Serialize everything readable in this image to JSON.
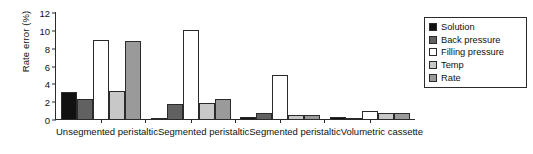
{
  "chart_data": {
    "type": "bar",
    "title": "",
    "subtitle": "",
    "xlabel": "",
    "ylabel": "Rate error (%)",
    "ylim": [
      0,
      12
    ],
    "yticks": [
      0,
      2,
      4,
      6,
      8,
      10,
      12
    ],
    "grid": false,
    "legend_position": "top-right",
    "categories": [
      "Unsegmented peristaltic",
      "Segmented peristaltic",
      "Segmented peristaltic",
      "Volumetric cassette"
    ],
    "series": [
      {
        "name": "Solution",
        "color": "#111111",
        "values": [
          3.0,
          0.15,
          0.2,
          0.25
        ]
      },
      {
        "name": "Back pressure",
        "color": "#616161",
        "values": [
          2.3,
          1.7,
          0.7,
          0.1
        ]
      },
      {
        "name": "Filling pressure",
        "color": "#ffffff",
        "values": [
          8.9,
          10.0,
          4.9,
          0.9
        ]
      },
      {
        "name": "Temp",
        "color": "#c8c8c8",
        "values": [
          3.1,
          1.8,
          0.4,
          0.7
        ]
      },
      {
        "name": "Rate",
        "color": "#9a9a9a",
        "values": [
          8.8,
          2.3,
          0.5,
          0.7
        ]
      }
    ]
  },
  "axis": {
    "y_title": "Rate error (%)",
    "y_tick_labels": [
      "0",
      "2",
      "4",
      "6",
      "8",
      "10",
      "12"
    ]
  },
  "legend": {
    "entries": [
      {
        "label": "Solution"
      },
      {
        "label": "Back pressure"
      },
      {
        "label": "Filling pressure"
      },
      {
        "label": "Temp"
      },
      {
        "label": "Rate"
      }
    ]
  },
  "colors": {
    "axis": "#2b2b2b",
    "background": "#ffffff",
    "text": "#111111"
  }
}
